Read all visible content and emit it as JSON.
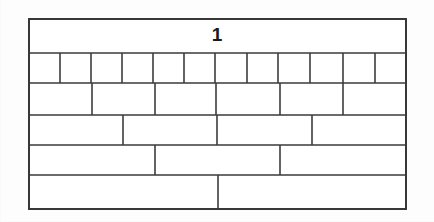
{
  "figure": {
    "label": "1",
    "label_position": {
      "x": 217,
      "y": 36
    },
    "background_color": "#fdfdfd",
    "line_color": "#3a3a3a",
    "fill_color": "#ffffff",
    "label_color": "#1a1a1a",
    "frame": {
      "x": 29,
      "y": 19,
      "width": 377,
      "height": 190
    },
    "row_boundaries_y": [
      19,
      53,
      83,
      115,
      145,
      175,
      209
    ],
    "rows": [
      {
        "index": 1,
        "name": "title-row",
        "y_top": 19,
        "y_bottom": 53,
        "cell_count": 1,
        "dividers_x": [],
        "contains_label": true
      },
      {
        "index": 2,
        "name": "twelve-cell-row",
        "y_top": 53,
        "y_bottom": 83,
        "cell_count": 12,
        "dividers_x": [
          60,
          91,
          122,
          153,
          184,
          215,
          247,
          278,
          310,
          343,
          375
        ]
      },
      {
        "index": 3,
        "name": "six-cell-row",
        "y_top": 83,
        "y_bottom": 115,
        "cell_count": 6,
        "dividers_x": [
          92,
          155,
          216,
          280,
          343
        ]
      },
      {
        "index": 4,
        "name": "four-cell-row",
        "y_top": 115,
        "y_bottom": 145,
        "cell_count": 4,
        "dividers_x": [
          123,
          217,
          312
        ]
      },
      {
        "index": 5,
        "name": "three-cell-row",
        "y_top": 145,
        "y_bottom": 175,
        "cell_count": 3,
        "dividers_x": [
          155,
          280
        ]
      },
      {
        "index": 6,
        "name": "two-cell-row",
        "y_top": 175,
        "y_bottom": 209,
        "cell_count": 2,
        "dividers_x": [
          218
        ]
      }
    ]
  }
}
